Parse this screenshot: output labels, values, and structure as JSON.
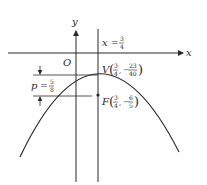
{
  "diagram": {
    "type": "parabola-graph",
    "axes": {
      "x_label": "x",
      "y_label": "y",
      "origin_label": "O"
    },
    "axis_of_symmetry": {
      "label_var": "x",
      "label_eq": "=",
      "label_num": "3",
      "label_den": "4"
    },
    "vertex": {
      "label": "V",
      "x_num": "3",
      "x_den": "4",
      "y_sign": "−",
      "y_num": "23",
      "y_den": "40"
    },
    "focus": {
      "label": "F",
      "x_num": "3",
      "x_den": "4",
      "y_sign": "−",
      "y_num": "6",
      "y_den": "5"
    },
    "focal_distance": {
      "label_var": "p",
      "label_eq": "=",
      "label_num": "5",
      "label_den": "8"
    },
    "colors": {
      "stroke": "#2a2a2a",
      "background": "#ffffff"
    }
  }
}
